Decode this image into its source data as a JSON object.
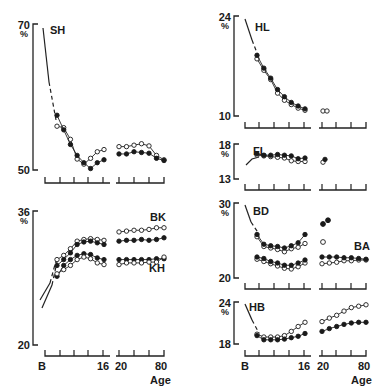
{
  "figure": {
    "x_tick_labels": {
      "start": "B",
      "sixteen": "16",
      "twenty": "20",
      "eighty": "80"
    },
    "x_axis_label": "Age",
    "unit": "%"
  },
  "chart_data": [
    {
      "type": "line",
      "title": "SH",
      "ylabel": "%",
      "ylim": [
        50,
        70
      ],
      "xlabel": "Age",
      "x_ticks": [
        "B",
        "",
        "",
        "",
        "16",
        "20",
        "",
        "",
        "80"
      ],
      "series": [
        {
          "name": "closed",
          "marker": "filled",
          "values": [
            57.5,
            55.5,
            53.5,
            52,
            51,
            50.2,
            51,
            51.4,
            52.2,
            52.2,
            52.5,
            52.4,
            52.3,
            51.6,
            51.3
          ]
        },
        {
          "name": "open",
          "marker": "open",
          "values": [
            56,
            55.8,
            54.2,
            51.5,
            50.8,
            51.6,
            52.5,
            52.8,
            53.2,
            53.2,
            53.4,
            53.6,
            53.3,
            52,
            51.4
          ]
        }
      ]
    },
    {
      "type": "line",
      "title": "BK / KH",
      "ylabel": "%",
      "ylim": [
        20,
        36
      ],
      "xlabel": "Age",
      "x_ticks": [
        "B",
        "",
        "",
        "",
        "16",
        "20",
        "",
        "",
        "80"
      ],
      "annotations": [
        "BK",
        "KH"
      ],
      "series": [
        {
          "name": "BK open",
          "marker": "open",
          "values": [
            30.2,
            30.7,
            31.5,
            32.4,
            32.6,
            32.7,
            32.6,
            32.5,
            33.5,
            33.6,
            33.7,
            33.7,
            33.8,
            34,
            34
          ]
        },
        {
          "name": "BK closed",
          "marker": "filled",
          "values": [
            29.5,
            30.2,
            31,
            32,
            32.3,
            32.4,
            32.2,
            32,
            32.4,
            32.5,
            32.5,
            32.6,
            32.5,
            32.6,
            32.8
          ]
        },
        {
          "name": "KH closed",
          "marker": "filled",
          "values": [
            28.2,
            29.5,
            30.2,
            30.7,
            30.9,
            30.8,
            30.4,
            30.2,
            30.2,
            30.2,
            30.2,
            30.2,
            30.2,
            30.3,
            30.3
          ]
        },
        {
          "name": "KH open",
          "marker": "open",
          "values": [
            28.5,
            29,
            29.5,
            30.2,
            30.5,
            30.3,
            29.8,
            29.6,
            29.6,
            29.8,
            29.8,
            29.8,
            29.9,
            29.9,
            30.5
          ]
        }
      ]
    },
    {
      "type": "line",
      "title": "HL",
      "ylabel": "%",
      "ylim": [
        10,
        24
      ],
      "series": [
        {
          "name": "closed",
          "marker": "filled",
          "values": [
            18.5,
            16.7,
            15.3,
            13.7,
            12.7,
            11.9,
            11.4,
            11
          ]
        },
        {
          "name": "open",
          "marker": "open",
          "values": [
            18,
            16.4,
            15.1,
            13.2,
            12.2,
            11.6,
            11.1,
            10.8
          ]
        }
      ],
      "adult_points": [
        10.7,
        10.7
      ]
    },
    {
      "type": "line",
      "title": "FL",
      "ylabel": "%",
      "ylim": [
        13,
        18
      ],
      "series": [
        {
          "name": "closed",
          "marker": "filled",
          "values": [
            16.6,
            16.4,
            16.4,
            16.5,
            16.4,
            16.3,
            15.9,
            16
          ]
        },
        {
          "name": "open",
          "marker": "open",
          "values": [
            16.4,
            16.3,
            16.2,
            16.1,
            16,
            15.6,
            15.5,
            15.5
          ]
        }
      ],
      "adult_points": [
        15.7,
        15.5
      ]
    },
    {
      "type": "line",
      "title": "BD / BA",
      "ylabel": "%",
      "ylim": [
        20,
        30
      ],
      "annotations": [
        "BD",
        "BA"
      ],
      "series": [
        {
          "name": "BD closed",
          "marker": "filled",
          "values": [
            25.8,
            24.5,
            24.3,
            24.2,
            24,
            24.3,
            24.7,
            25.8
          ]
        },
        {
          "name": "BD open",
          "marker": "open",
          "values": [
            25.5,
            24.2,
            24,
            23.8,
            23.5,
            23.9,
            24.1,
            24.6
          ]
        },
        {
          "name": "BD adult",
          "marker": "mixed",
          "values": [
            27.3,
            27.8,
            24.8
          ]
        },
        {
          "name": "BA closed",
          "marker": "filled",
          "values": [
            22.8,
            22.6,
            22.2,
            22,
            21.7,
            21.7,
            22,
            22.4,
            22.8,
            22.8,
            22.8,
            22.7,
            22.7,
            22.6,
            22.5
          ]
        },
        {
          "name": "BA open",
          "marker": "open",
          "values": [
            22.5,
            22.2,
            21.9,
            21.6,
            21.3,
            21.2,
            21.5,
            22,
            21.9,
            22,
            22.1,
            22.3,
            22.3,
            22.4,
            22.4
          ]
        }
      ]
    },
    {
      "type": "line",
      "title": "HB",
      "ylabel": "%",
      "ylim": [
        18,
        24
      ],
      "series": [
        {
          "name": "open",
          "marker": "open",
          "values": [
            19.4,
            19,
            19,
            19,
            19.2,
            19.8,
            20.5,
            21.1,
            21.2,
            21.7,
            22.1,
            22.7,
            23.2,
            23.4,
            23.6
          ]
        },
        {
          "name": "closed",
          "marker": "filled",
          "values": [
            19.2,
            18.6,
            18.6,
            18.6,
            18.7,
            18.9,
            19.1,
            19.5,
            19.8,
            20.2,
            20.5,
            20.8,
            21,
            21.1,
            21.1
          ]
        }
      ]
    }
  ]
}
